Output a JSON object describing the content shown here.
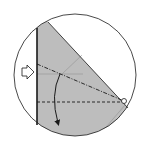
{
  "diagram": {
    "type": "origami-fold-step",
    "colors": {
      "background": "#ffffff",
      "paper": "#b9b9b9",
      "paper_light": "#cfcfcf",
      "line": "#1a1a1a",
      "crease": "#8a8a8a"
    },
    "circle": {
      "cx": 75,
      "cy": 75,
      "r": 61
    },
    "symbols": {
      "push_arrow": "open-arrow (push/squash here)",
      "fold_arrow": "curved arrow (fold down)",
      "pivot_point": "circle marker at fold pivot",
      "mountain_fold": "dash-dot line",
      "valley_fold": "dashed line"
    }
  }
}
